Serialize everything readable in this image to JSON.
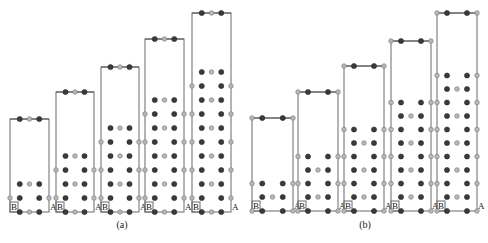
{
  "figure": {
    "panels": [
      {
        "id": "a",
        "caption": "(a)",
        "caption_pos": [
          122,
          228
        ],
        "variant": "a",
        "cells": [
          {
            "x": 10,
            "w": 39,
            "top": 119,
            "bottom": 212,
            "layers": 2
          },
          {
            "x": 56,
            "w": 38,
            "top": 92,
            "bottom": 212,
            "layers": 4
          },
          {
            "x": 101,
            "w": 38,
            "top": 67,
            "bottom": 212,
            "layers": 6
          },
          {
            "x": 145,
            "w": 39,
            "top": 39,
            "bottom": 212,
            "layers": 8
          },
          {
            "x": 192,
            "w": 39,
            "top": 13,
            "bottom": 212,
            "layers": 10
          }
        ]
      },
      {
        "id": "b",
        "caption": "(b)",
        "caption_pos": [
          365,
          228
        ],
        "variant": "b",
        "cells": [
          {
            "x": 252,
            "w": 41,
            "top": 118,
            "bottom": 211,
            "layers": 2
          },
          {
            "x": 298,
            "w": 40,
            "top": 92,
            "bottom": 211,
            "layers": 4
          },
          {
            "x": 344,
            "w": 40,
            "top": 66,
            "bottom": 211,
            "layers": 6
          },
          {
            "x": 391,
            "w": 40,
            "top": 41,
            "bottom": 211,
            "layers": 8
          },
          {
            "x": 437,
            "w": 40,
            "top": 13,
            "bottom": 211,
            "layers": 10
          }
        ]
      }
    ],
    "axis_labels": {
      "left": "B",
      "right": "A"
    },
    "colors": {
      "dark_atom": "#3a3a3a",
      "light_atom": "#b8b8b8",
      "cell_edge": "#6a6a6a"
    }
  }
}
